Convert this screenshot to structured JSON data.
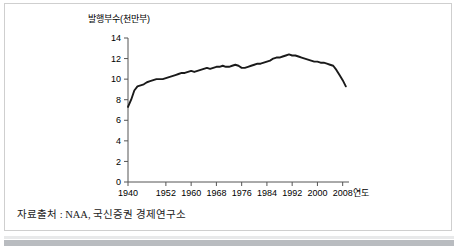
{
  "figure": {
    "source_note": "자료출처 : NAA, 국신증권 경제연구소",
    "y_axis_title": "발행부수(천만부)",
    "x_axis_unit": "연도",
    "line_color": "#1a1a1a",
    "axis_color": "#555555",
    "background": "#ffffff",
    "border_color": "#cfcfcf"
  },
  "chart_data": {
    "type": "line",
    "title": "",
    "subtitle": "",
    "xlabel": "연도",
    "ylabel": "발행부수(천만부)",
    "xlim": [
      1940,
      2010
    ],
    "ylim": [
      0,
      14
    ],
    "grid": false,
    "legend": null,
    "xticks": [
      1940,
      1952,
      1960,
      1968,
      1976,
      1984,
      1992,
      2000,
      2008
    ],
    "xtick_labels": [
      "1940",
      "1952",
      "1960",
      "1968",
      "1976",
      "1984",
      "1992",
      "2000",
      "2008"
    ],
    "yticks": [
      0,
      2,
      4,
      6,
      8,
      10,
      12,
      14
    ],
    "ytick_labels": [
      "0",
      "2",
      "4",
      "6",
      "8",
      "10",
      "12",
      "14"
    ],
    "series": [
      {
        "name": "발행부수",
        "color": "#1a1a1a",
        "x": [
          1940,
          1941,
          1942,
          1943,
          1944,
          1945,
          1946,
          1947,
          1948,
          1949,
          1950,
          1951,
          1952,
          1953,
          1954,
          1955,
          1956,
          1957,
          1958,
          1959,
          1960,
          1961,
          1962,
          1963,
          1964,
          1965,
          1966,
          1967,
          1968,
          1969,
          1970,
          1971,
          1972,
          1973,
          1974,
          1975,
          1976,
          1977,
          1978,
          1979,
          1980,
          1981,
          1982,
          1983,
          1984,
          1985,
          1986,
          1987,
          1988,
          1989,
          1990,
          1991,
          1992,
          1993,
          1994,
          1995,
          1996,
          1997,
          1998,
          1999,
          2000,
          2001,
          2002,
          2003,
          2004,
          2005,
          2006,
          2007,
          2008,
          2009
        ],
        "values": [
          7.3,
          8.0,
          8.9,
          9.3,
          9.4,
          9.5,
          9.7,
          9.8,
          9.9,
          10.0,
          10.0,
          10.0,
          10.1,
          10.2,
          10.3,
          10.4,
          10.5,
          10.6,
          10.6,
          10.7,
          10.8,
          10.7,
          10.8,
          10.9,
          11.0,
          11.1,
          11.0,
          11.1,
          11.2,
          11.2,
          11.3,
          11.2,
          11.2,
          11.3,
          11.4,
          11.3,
          11.1,
          11.1,
          11.2,
          11.3,
          11.4,
          11.5,
          11.5,
          11.6,
          11.7,
          11.8,
          12.0,
          12.1,
          12.1,
          12.2,
          12.3,
          12.4,
          12.3,
          12.3,
          12.2,
          12.1,
          12.0,
          11.9,
          11.8,
          11.7,
          11.7,
          11.6,
          11.6,
          11.5,
          11.4,
          11.3,
          10.9,
          10.4,
          9.9,
          9.3
        ]
      }
    ]
  }
}
